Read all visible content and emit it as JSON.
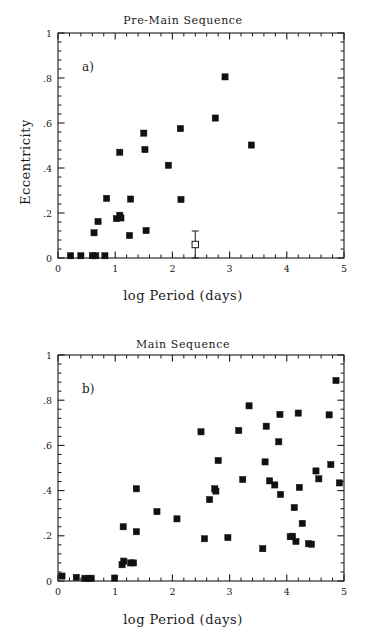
{
  "figure": {
    "width": 366,
    "height": 639,
    "background": "#ffffff",
    "ink_color": "#1a1a1a",
    "marker_color": "#111111"
  },
  "axis_labels": {
    "x": "log Period (days)",
    "y": "Eccentricity"
  },
  "chart_data": [
    {
      "type": "scatter",
      "title": "Pre-Main Sequence",
      "panel_letter": "a)",
      "xlabel": "log Period (days)",
      "ylabel": "Eccentricity",
      "xlim": [
        0,
        5
      ],
      "ylim": [
        0,
        1
      ],
      "xticks": [
        0,
        1,
        2,
        3,
        4,
        5
      ],
      "xticklabels": [
        "0",
        "1",
        "2",
        "3",
        "4",
        "5"
      ],
      "yticks": [
        0,
        0.2,
        0.4,
        0.6,
        0.8,
        1
      ],
      "yticklabels": [
        "0",
        ".2",
        ".4",
        ".6",
        ".8",
        "1"
      ],
      "xminor_per_major": 5,
      "yminor_per_major": 5,
      "grid": false,
      "legend": null,
      "series": [
        {
          "name": "Pre-main sequence binaries",
          "marker": "filled-square",
          "points": [
            [
              0.22,
              0.01
            ],
            [
              0.4,
              0.01
            ],
            [
              0.6,
              0.01
            ],
            [
              0.66,
              0.01
            ],
            [
              0.82,
              0.01
            ],
            [
              0.63,
              0.112
            ],
            [
              0.7,
              0.162
            ],
            [
              0.85,
              0.265
            ],
            [
              1.02,
              0.175
            ],
            [
              1.08,
              0.19
            ],
            [
              1.1,
              0.178
            ],
            [
              1.08,
              0.47
            ],
            [
              1.25,
              0.1
            ],
            [
              1.27,
              0.262
            ],
            [
              1.5,
              0.555
            ],
            [
              1.52,
              0.482
            ],
            [
              1.54,
              0.122
            ],
            [
              1.93,
              0.412
            ],
            [
              2.14,
              0.575
            ],
            [
              2.15,
              0.26
            ],
            [
              2.75,
              0.622
            ],
            [
              2.92,
              0.805
            ],
            [
              3.38,
              0.502
            ]
          ]
        },
        {
          "name": "Mean with error bar",
          "marker": "open-square-errorbar",
          "points": [
            [
              2.4,
              0.06
            ]
          ],
          "yerr": [
            0.06
          ]
        }
      ]
    },
    {
      "type": "scatter",
      "title": "Main Sequence",
      "panel_letter": "b)",
      "xlabel": "log Period (days)",
      "ylabel": "Eccentricity",
      "xlim": [
        0,
        5
      ],
      "ylim": [
        0,
        1
      ],
      "xticks": [
        0,
        1,
        2,
        3,
        4,
        5
      ],
      "xticklabels": [
        "0",
        "1",
        "2",
        "3",
        "4",
        "5"
      ],
      "yticks": [
        0,
        0.2,
        0.4,
        0.6,
        0.8,
        1
      ],
      "yticklabels": [
        "0",
        ".2",
        ".4",
        ".6",
        ".8",
        "1"
      ],
      "xminor_per_major": 5,
      "yminor_per_major": 5,
      "grid": false,
      "legend": null,
      "series": [
        {
          "name": "Main sequence binaries",
          "marker": "filled-square",
          "points": [
            [
              0.07,
              0.022
            ],
            [
              0.32,
              0.016
            ],
            [
              0.47,
              0.012
            ],
            [
              0.54,
              0.012
            ],
            [
              0.58,
              0.012
            ],
            [
              0.99,
              0.013
            ],
            [
              1.12,
              0.072
            ],
            [
              1.15,
              0.088
            ],
            [
              1.14,
              0.24
            ],
            [
              1.27,
              0.08
            ],
            [
              1.32,
              0.08
            ],
            [
              1.37,
              0.408
            ],
            [
              1.37,
              0.218
            ],
            [
              1.73,
              0.307
            ],
            [
              2.08,
              0.275
            ],
            [
              2.5,
              0.66
            ],
            [
              2.56,
              0.187
            ],
            [
              2.65,
              0.36
            ],
            [
              2.74,
              0.408
            ],
            [
              2.76,
              0.398
            ],
            [
              2.8,
              0.533
            ],
            [
              2.97,
              0.192
            ],
            [
              3.16,
              0.666
            ],
            [
              3.23,
              0.449
            ],
            [
              3.34,
              0.775
            ],
            [
              3.58,
              0.143
            ],
            [
              3.62,
              0.527
            ],
            [
              3.64,
              0.685
            ],
            [
              3.7,
              0.443
            ],
            [
              3.79,
              0.425
            ],
            [
              3.86,
              0.616
            ],
            [
              3.88,
              0.737
            ],
            [
              3.89,
              0.383
            ],
            [
              4.06,
              0.196
            ],
            [
              4.1,
              0.198
            ],
            [
              4.13,
              0.325
            ],
            [
              4.16,
              0.175
            ],
            [
              4.2,
              0.743
            ],
            [
              4.22,
              0.414
            ],
            [
              4.27,
              0.255
            ],
            [
              4.38,
              0.165
            ],
            [
              4.43,
              0.163
            ],
            [
              4.51,
              0.487
            ],
            [
              4.56,
              0.452
            ],
            [
              4.74,
              0.735
            ],
            [
              4.77,
              0.515
            ],
            [
              4.86,
              0.887
            ],
            [
              4.92,
              0.434
            ]
          ]
        }
      ]
    }
  ]
}
